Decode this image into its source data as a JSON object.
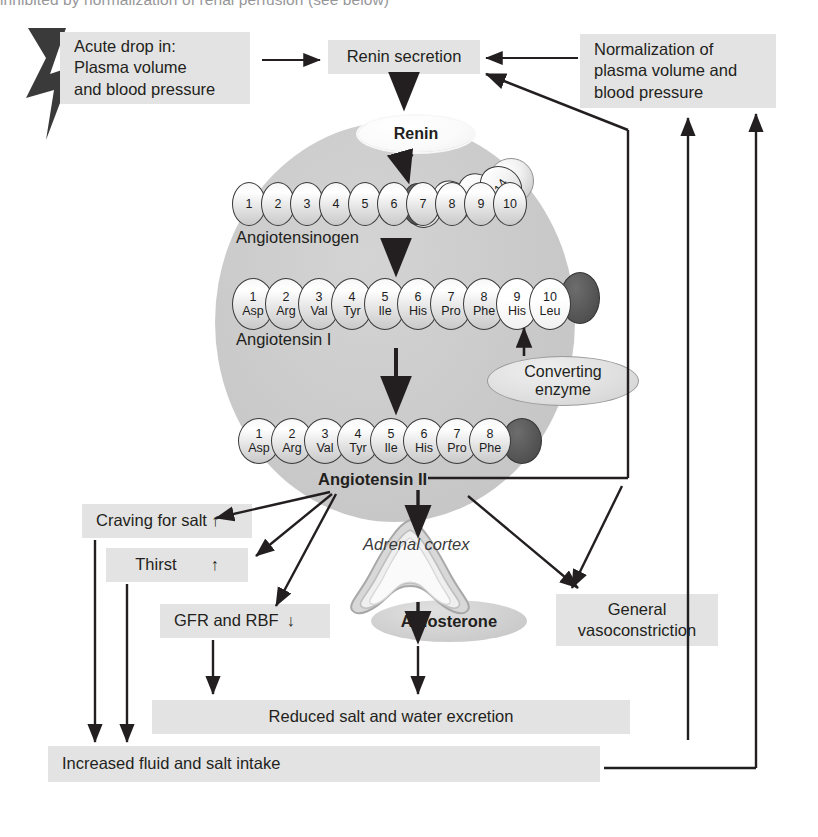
{
  "page": {
    "truncated_header": "inhibited by normalization of renal perfusion (see below)"
  },
  "boxes": {
    "acute_drop": {
      "line1": "Acute drop in:",
      "line2": "Plasma volume",
      "line3": "and blood pressure"
    },
    "renin_secretion": {
      "label": "Renin secretion"
    },
    "normalization": {
      "line1": "Normalization of",
      "line2": "plasma volume and",
      "line3": "blood pressure"
    },
    "craving_for_salt": {
      "label": "Craving for salt",
      "arrow": "↑"
    },
    "thirst": {
      "label": "Thirst",
      "arrow": "↑"
    },
    "gfr_rbf": {
      "label": "GFR and RBF",
      "arrow": "↓"
    },
    "general_vasoconstriction": {
      "line1": "General",
      "line2": "vasoconstriction"
    },
    "reduced_excretion": {
      "label": "Reduced salt and water excretion"
    },
    "increased_intake": {
      "label": "Increased fluid and salt intake"
    }
  },
  "ovals": {
    "renin": {
      "label": "Renin"
    },
    "converting_enzyme": {
      "line1": "Converting",
      "line2": "enzyme"
    },
    "aldosterone": {
      "label": "Aldosterone"
    }
  },
  "organ": {
    "adrenal_cortex": {
      "label": "Adrenal cortex"
    }
  },
  "chains": {
    "angiotensinogen": {
      "label": "Angiotensinogen",
      "residues": [
        "1",
        "2",
        "3",
        "4",
        "5",
        "6",
        "7",
        "8",
        "9",
        "10"
      ],
      "tail_residues": [
        "11",
        "12",
        "13",
        "14"
      ]
    },
    "angiotensin_i": {
      "label": "Angiotensin I",
      "residues": [
        {
          "n": "1",
          "aa": "Asp"
        },
        {
          "n": "2",
          "aa": "Arg"
        },
        {
          "n": "3",
          "aa": "Val"
        },
        {
          "n": "4",
          "aa": "Tyr"
        },
        {
          "n": "5",
          "aa": "Ile"
        },
        {
          "n": "6",
          "aa": "His"
        },
        {
          "n": "7",
          "aa": "Pro"
        },
        {
          "n": "8",
          "aa": "Phe"
        },
        {
          "n": "9",
          "aa": "His"
        },
        {
          "n": "10",
          "aa": "Leu"
        }
      ]
    },
    "angiotensin_ii": {
      "label": "Angiotensin II",
      "residues": [
        {
          "n": "1",
          "aa": "Asp"
        },
        {
          "n": "2",
          "aa": "Arg"
        },
        {
          "n": "3",
          "aa": "Val"
        },
        {
          "n": "4",
          "aa": "Tyr"
        },
        {
          "n": "5",
          "aa": "Ile"
        },
        {
          "n": "6",
          "aa": "His"
        },
        {
          "n": "7",
          "aa": "Pro"
        },
        {
          "n": "8",
          "aa": "Phe"
        }
      ]
    }
  },
  "colors": {
    "box_fill": "#e3e3e3",
    "circle_fill": "#cacaca",
    "ink": "#231f20",
    "residue_dark": "#555555"
  }
}
